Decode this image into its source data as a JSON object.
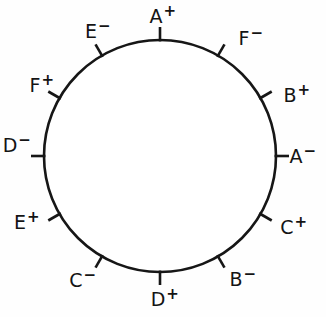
{
  "diagram": {
    "background_color": "#fefefe",
    "line_color": "#161616",
    "fill_color": "#ffffff",
    "circle": {
      "center_x": 160,
      "center_y": 156,
      "radius": 116,
      "stroke_width": 2.6
    },
    "tick": {
      "count": 12,
      "spacing_degrees": 30,
      "length": 13
    },
    "terminals": [
      {
        "label": "A",
        "sign": "+",
        "text": "A+",
        "angle_deg": 0,
        "label_x": 163,
        "label_y": 16
      },
      {
        "label": "F",
        "sign": "-",
        "text": "F-",
        "angle_deg": 30,
        "label_x": 251,
        "label_y": 38
      },
      {
        "label": "B",
        "sign": "+",
        "text": "B+",
        "angle_deg": 60,
        "label_x": 297,
        "label_y": 95
      },
      {
        "label": "A",
        "sign": "-",
        "text": "A-",
        "angle_deg": 90,
        "label_x": 303,
        "label_y": 156
      },
      {
        "label": "C",
        "sign": "+",
        "text": "C+",
        "angle_deg": 120,
        "label_x": 294,
        "label_y": 227
      },
      {
        "label": "B",
        "sign": "-",
        "text": "B-",
        "angle_deg": 150,
        "label_x": 243,
        "label_y": 279
      },
      {
        "label": "D",
        "sign": "+",
        "text": "D+",
        "angle_deg": 180,
        "label_x": 165,
        "label_y": 299
      },
      {
        "label": "C",
        "sign": "-",
        "text": "C-",
        "angle_deg": 210,
        "label_x": 83,
        "label_y": 280
      },
      {
        "label": "E",
        "sign": "+",
        "text": "E+",
        "angle_deg": 240,
        "label_x": 27,
        "label_y": 222
      },
      {
        "label": "D",
        "sign": "-",
        "text": "D-",
        "angle_deg": 270,
        "label_x": 17,
        "label_y": 145
      },
      {
        "label": "F",
        "sign": "+",
        "text": "F+",
        "angle_deg": 300,
        "label_x": 42,
        "label_y": 85
      },
      {
        "label": "E",
        "sign": "-",
        "text": "E-",
        "angle_deg": 330,
        "label_x": 98,
        "label_y": 31
      }
    ]
  }
}
